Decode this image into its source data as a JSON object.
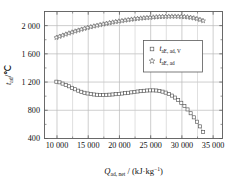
{
  "chart_data": {
    "type": "scatter",
    "title": "",
    "xlabel_parts": {
      "sym": "Q",
      "sub": "ad, net",
      "sep": " / ",
      "unit_main": "(kJ·kg",
      "unit_sup": "−1",
      "unit_tail": ")"
    },
    "ylabel_parts": {
      "sym": "t",
      "sub": "ad",
      "sep": "/",
      "unit": "℃"
    },
    "xlabel": "Q_ad,net / (kJ·kg⁻¹)",
    "ylabel": "t_ad/℃",
    "xlim": [
      8000,
      36500
    ],
    "ylim": [
      400,
      2200
    ],
    "xticks": [
      10000,
      15000,
      20000,
      25000,
      30000,
      35000
    ],
    "xticklabels": [
      "10 000",
      "15 000",
      "20 000",
      "25 000",
      "30 000",
      "35 000"
    ],
    "yticks": [
      400,
      800,
      1200,
      1600,
      2000
    ],
    "yticklabels": [
      "400",
      "800",
      "1 200",
      "1 600",
      "2 000"
    ],
    "grid": true,
    "minor_ticks": true,
    "legend_position": "center-right-upper",
    "series": [
      {
        "name": "t_aE, ad, V",
        "name_parts": {
          "sym": "t",
          "sub": "aE, ad, V"
        },
        "marker": "square",
        "color": "#555555",
        "x": [
          9900,
          10400,
          10900,
          11400,
          11900,
          12400,
          12900,
          13400,
          13900,
          14400,
          14900,
          15400,
          15900,
          16400,
          16900,
          17400,
          17900,
          18400,
          18900,
          19400,
          19900,
          20400,
          20900,
          21400,
          21900,
          22400,
          22900,
          23400,
          23900,
          24400,
          24900,
          25400,
          25900,
          26400,
          26900,
          27400,
          27900,
          28400,
          28900,
          29400,
          29900,
          30400,
          30900,
          31400,
          31900,
          32400,
          32900,
          33400
        ],
        "y": [
          1205,
          1196,
          1178,
          1160,
          1140,
          1118,
          1098,
          1078,
          1062,
          1048,
          1038,
          1030,
          1024,
          1020,
          1018,
          1018,
          1019,
          1021,
          1024,
          1028,
          1032,
          1037,
          1042,
          1048,
          1054,
          1060,
          1066,
          1071,
          1076,
          1080,
          1082,
          1082,
          1080,
          1074,
          1064,
          1050,
          1032,
          1008,
          980,
          946,
          906,
          862,
          812,
          758,
          700,
          638,
          572,
          492
        ]
      },
      {
        "name": "t_aE, ad",
        "name_parts": {
          "sym": "t",
          "sub": "aE, ad"
        },
        "marker": "star",
        "color": "#555555",
        "x": [
          9900,
          10400,
          10900,
          11400,
          11900,
          12400,
          12900,
          13400,
          13900,
          14400,
          14900,
          15400,
          15900,
          16400,
          16900,
          17400,
          17900,
          18400,
          18900,
          19400,
          19900,
          20400,
          20900,
          21400,
          21900,
          22400,
          22900,
          23400,
          23900,
          24400,
          24900,
          25400,
          25900,
          26400,
          26900,
          27400,
          27900,
          28400,
          28900,
          29400,
          29900,
          30400,
          30900,
          31400,
          31900,
          32400,
          32900,
          33400
        ],
        "y": [
          1830,
          1846,
          1862,
          1877,
          1892,
          1906,
          1920,
          1933,
          1946,
          1958,
          1970,
          1981,
          1992,
          2002,
          2012,
          2021,
          2030,
          2039,
          2047,
          2055,
          2062,
          2069,
          2076,
          2082,
          2088,
          2094,
          2099,
          2104,
          2108,
          2112,
          2116,
          2119,
          2122,
          2125,
          2127,
          2129,
          2130,
          2131,
          2131,
          2130,
          2128,
          2125,
          2121,
          2115,
          2107,
          2097,
          2084,
          2068
        ]
      }
    ]
  },
  "legend": {
    "items": [
      {
        "marker": "square",
        "label": "t_aE, ad, V"
      },
      {
        "marker": "star",
        "label": "t_aE, ad"
      }
    ]
  }
}
